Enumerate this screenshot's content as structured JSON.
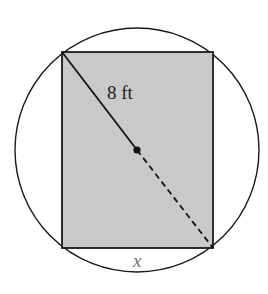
{
  "diagram": {
    "type": "rectangle inscribed in circle",
    "circle": {
      "cx": 137,
      "cy": 150,
      "r": 122,
      "stroke": "#1a1a1a",
      "fill": "#ffffff"
    },
    "rectangle": {
      "x1": 62,
      "y1": 52,
      "x2": 213,
      "y2": 248,
      "fill": "#c9c9c9",
      "stroke": "#1a1a1a"
    },
    "center_point": {
      "cx": 137,
      "cy": 150,
      "r": 3.6,
      "color": "#111111"
    },
    "diagonal": {
      "solid_segment": {
        "from": [
          62,
          52
        ],
        "to": [
          137,
          150
        ]
      },
      "dashed_segment": {
        "from": [
          137,
          150
        ],
        "to": [
          213,
          248
        ],
        "dash": "6 4"
      }
    },
    "labels": {
      "radius_label": "8 ft",
      "side_label": "x"
    }
  }
}
